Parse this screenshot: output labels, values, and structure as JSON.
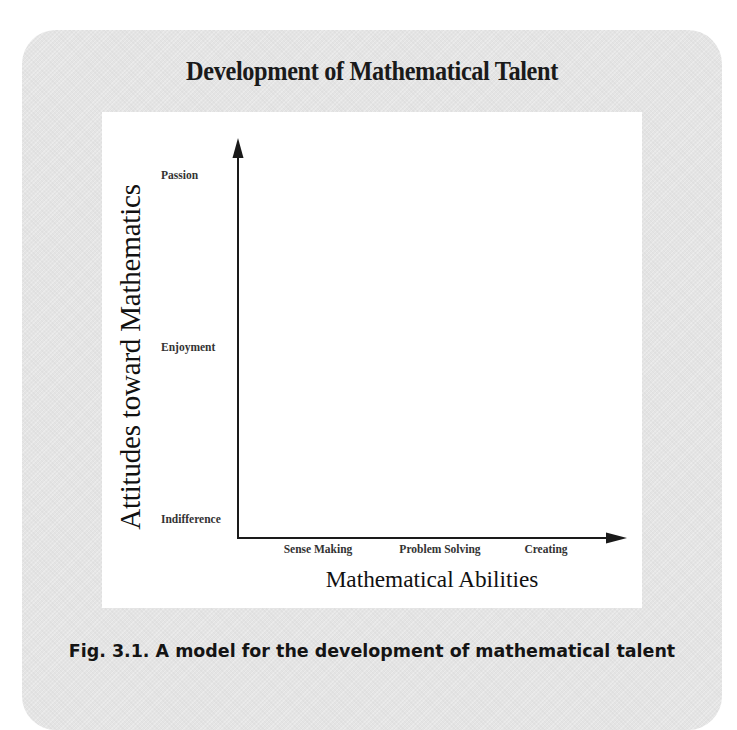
{
  "title": "Development of Mathematical Talent",
  "caption": "Fig. 3.1. A model for the development of mathematical talent",
  "axes": {
    "y_label": "Attitudes toward Mathematics",
    "x_label": "Mathematical Abilities",
    "y_ticks": [
      "Indifference",
      "Enjoyment",
      "Passion"
    ],
    "x_ticks": [
      "Sense Making",
      "Problem Solving",
      "Creating"
    ]
  },
  "colors": {
    "panel_background": "#e4e4e4",
    "figure_background": "#ffffff",
    "axis_color": "#1a1a1a",
    "text_color": "#141414"
  }
}
